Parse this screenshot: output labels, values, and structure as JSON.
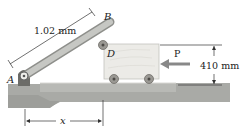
{
  "diagram": {
    "labels": {
      "point_a": "A",
      "point_b": "B",
      "point_d": "D",
      "force": "P",
      "bar_length": "1.02 mm",
      "height": "410 mm",
      "distance": "x"
    },
    "colors": {
      "ground": "#a9aaa6",
      "ground_dark": "#8f908c",
      "bar": "#b5b6b2",
      "block": "#e9e8e4",
      "wheel": "#8c8a84",
      "arrow": "#888888",
      "dim_line": "#333333"
    }
  }
}
